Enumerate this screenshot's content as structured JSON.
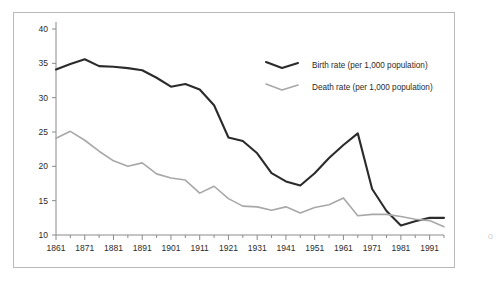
{
  "chart_data": {
    "type": "line",
    "title": "",
    "subtitle": "",
    "xlabel": "",
    "ylabel": "",
    "xlim": [
      1861,
      1996
    ],
    "ylim": [
      10,
      40
    ],
    "ytick_labels": [
      "10",
      "15",
      "20",
      "25",
      "30",
      "35",
      "40"
    ],
    "yticks": [
      10,
      15,
      20,
      25,
      30,
      35,
      40
    ],
    "xtick_labels": [
      "1861",
      "1871",
      "1881",
      "1891",
      "1901",
      "1911",
      "1921",
      "1931",
      "1941",
      "1951",
      "1961",
      "1971",
      "1981",
      "1991"
    ],
    "xticks": [
      1861,
      1871,
      1881,
      1891,
      1901,
      1911,
      1921,
      1931,
      1941,
      1951,
      1961,
      1971,
      1981,
      1991
    ],
    "minor_xtick_interval": 5,
    "grid": false,
    "legend_position": "top-right",
    "x": [
      1861,
      1866,
      1871,
      1876,
      1881,
      1886,
      1891,
      1896,
      1901,
      1906,
      1911,
      1916,
      1921,
      1926,
      1931,
      1936,
      1941,
      1946,
      1951,
      1956,
      1961,
      1966,
      1971,
      1976,
      1981,
      1986,
      1991,
      1996
    ],
    "series": [
      {
        "name": "Birth rate (per 1,000 population)",
        "color": "#2b2b2b",
        "width": 2.1,
        "values": [
          34.1,
          34.9,
          35.6,
          34.6,
          34.5,
          34.3,
          34.0,
          32.9,
          31.6,
          32.0,
          31.2,
          28.9,
          24.2,
          23.7,
          21.9,
          19.0,
          17.8,
          17.2,
          19.0,
          21.2,
          23.1,
          24.8,
          16.7,
          13.5,
          11.4,
          12.0,
          12.5,
          12.5
        ]
      },
      {
        "name": "Death rate (per 1,000 population)",
        "color": "#a8a8a8",
        "width": 1.6,
        "values": [
          24.1,
          25.1,
          23.8,
          22.2,
          20.8,
          20.0,
          20.5,
          18.9,
          18.3,
          18.0,
          16.1,
          17.1,
          15.3,
          14.2,
          14.1,
          13.6,
          14.1,
          13.2,
          14.0,
          14.4,
          15.4,
          12.8,
          13.0,
          13.0,
          12.7,
          12.3,
          12.1,
          11.2
        ]
      }
    ]
  },
  "legend": {
    "items": [
      {
        "label": "Birth rate (per 1,000 population)",
        "color": "#2b2b2b"
      },
      {
        "label": "Death rate (per 1,000 population)",
        "color": "#a8a8a8"
      }
    ]
  },
  "edge_artifact": "o"
}
